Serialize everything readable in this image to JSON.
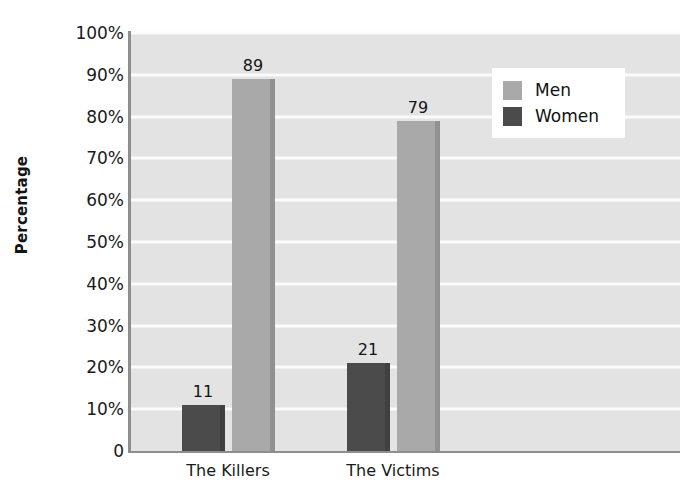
{
  "chart_data": {
    "type": "bar",
    "title": "",
    "subtitle": "",
    "xlabel": "",
    "ylabel": "Percentage",
    "categories": [
      "The Killers",
      "The Victims"
    ],
    "series": [
      {
        "name": "Women",
        "values": [
          11,
          21
        ],
        "color": "#4b4b4b"
      },
      {
        "name": "Men",
        "values": [
          89,
          79
        ],
        "color": "#a9a9a9"
      }
    ],
    "series_draw_order": [
      "Women",
      "Men"
    ],
    "legend_order": [
      "Men",
      "Women"
    ],
    "legend_position": "top-right",
    "ylim": [
      0,
      100
    ],
    "ytick_values": [
      0,
      10,
      20,
      30,
      40,
      50,
      60,
      70,
      80,
      90,
      100
    ],
    "ytick_labels": [
      "0",
      "10%",
      "20%",
      "30%",
      "40%",
      "50%",
      "60%",
      "70%",
      "80%",
      "90%",
      "100%"
    ],
    "data_labels": [
      "11",
      "89",
      "21",
      "79"
    ],
    "grid": "horizontal",
    "grid_color": "#fbfbfb",
    "plot_background": "#e3e3e3",
    "page_background": "#ffffff",
    "axis_line_color": "#8e8e8e"
  },
  "axis": {
    "y_title": "Percentage",
    "ticks": [
      {
        "label": "100%",
        "value": 100
      },
      {
        "label": "90%",
        "value": 90
      },
      {
        "label": "80%",
        "value": 80
      },
      {
        "label": "70%",
        "value": 70
      },
      {
        "label": "60%",
        "value": 60
      },
      {
        "label": "50%",
        "value": 50
      },
      {
        "label": "40%",
        "value": 40
      },
      {
        "label": "30%",
        "value": 30
      },
      {
        "label": "20%",
        "value": 20
      },
      {
        "label": "10%",
        "value": 10
      },
      {
        "label": "0",
        "value": 0
      }
    ]
  },
  "groups": [
    {
      "label": "The Killers",
      "bars": [
        {
          "series": "Women",
          "value": 11,
          "label": "11"
        },
        {
          "series": "Men",
          "value": 89,
          "label": "89"
        }
      ]
    },
    {
      "label": "The Victims",
      "bars": [
        {
          "series": "Women",
          "value": 21,
          "label": "21"
        },
        {
          "series": "Men",
          "value": 79,
          "label": "79"
        }
      ]
    }
  ],
  "legend": {
    "items": [
      {
        "label": "Men",
        "color": "#a9a9a9"
      },
      {
        "label": "Women",
        "color": "#4b4b4b"
      }
    ]
  }
}
